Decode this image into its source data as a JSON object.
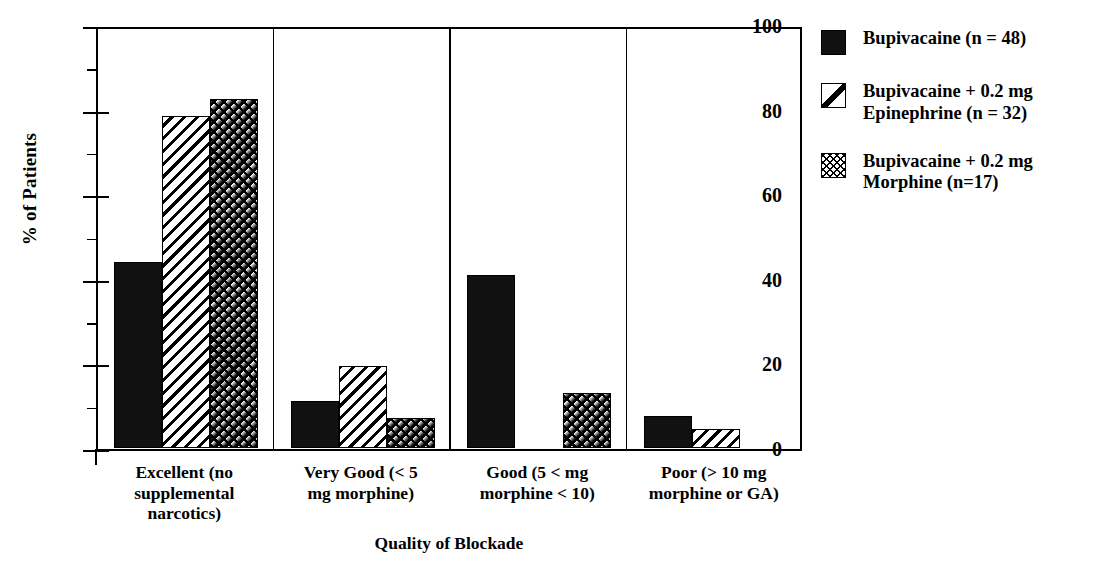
{
  "chart_data": {
    "type": "bar",
    "title": "",
    "xlabel": "Quality of Blockade",
    "ylabel": "% of Patients",
    "ylim": [
      0,
      100
    ],
    "ytick_labels": [
      "0",
      "20",
      "40",
      "60",
      "80",
      "100"
    ],
    "ytick_values": [
      0,
      20,
      40,
      60,
      80,
      100
    ],
    "yminor_values": [
      10,
      30,
      50,
      70,
      90
    ],
    "grid": false,
    "legend_position": "right",
    "panel_dividers": true,
    "categories": [
      "Excellent (no\nsupplemental\nnarcotics)",
      "Very Good (< 5\nmg morphine)",
      "Good (5 < mg\nmorphine < 10)",
      "Poor  (> 10 mg\nmorphine or GA)"
    ],
    "series": [
      {
        "name": "Bupivacaine (n = 48)",
        "pattern": "solid",
        "values": [
          44,
          11,
          41,
          7.5
        ]
      },
      {
        "name": "Bupivacaine + 0.2 mg Epinephrine (n = 32)",
        "pattern": "hatch",
        "values": [
          78.5,
          19.5,
          0,
          4.5
        ]
      },
      {
        "name": "Bupivacaine + 0.2 mg Morphine  (n=17)",
        "pattern": "cross",
        "values": [
          82.5,
          7,
          13,
          0
        ]
      }
    ]
  },
  "axes": {
    "y_title": "% of Patients",
    "x_title": "Quality of Blockade",
    "ticks": [
      {
        "label": "100",
        "value": 100
      },
      {
        "label": "80",
        "value": 80
      },
      {
        "label": "60",
        "value": 60
      },
      {
        "label": "40",
        "value": 40
      },
      {
        "label": "20",
        "value": 20
      },
      {
        "label": "0",
        "value": 0
      }
    ]
  },
  "categories": [
    {
      "line1": "Excellent (no",
      "line2": "supplemental",
      "line3": "narcotics)"
    },
    {
      "line1": "Very Good (< 5",
      "line2": "mg morphine)",
      "line3": ""
    },
    {
      "line1": "Good (5 < mg",
      "line2": "morphine < 10)",
      "line3": ""
    },
    {
      "line1": "Poor  (> 10 mg",
      "line2": "morphine or GA)",
      "line3": ""
    }
  ],
  "legend": {
    "items": [
      {
        "label": "Bupivacaine (n = 48)",
        "pattern": "solid"
      },
      {
        "label": "Bupivacaine + 0.2 mg\nEpinephrine (n = 32)",
        "pattern": "hatch"
      },
      {
        "label": "Bupivacaine + 0.2 mg\nMorphine    (n=17)",
        "pattern": "cross"
      }
    ]
  },
  "colors": {
    "ink": "#000000",
    "background": "#ffffff",
    "solid_fill": "#111111"
  }
}
